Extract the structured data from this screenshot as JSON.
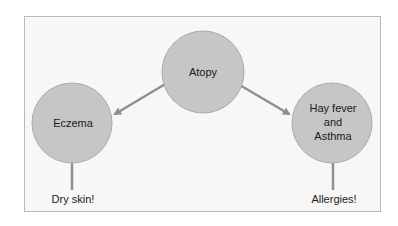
{
  "diagram": {
    "colors": {
      "background": "#f7f7f7",
      "border": "#b9b9b9",
      "node_fill": "#c6c6c6",
      "node_stroke": "#aaaaaa",
      "connector": "#8f8f8f",
      "text": "#1a1a1a"
    },
    "nodes": {
      "root": {
        "label": "Atopy"
      },
      "left": {
        "label": "Eczema"
      },
      "right": {
        "lines": [
          "Hay fever",
          "and",
          "Asthma"
        ]
      }
    },
    "leaves": {
      "left": {
        "label": "Dry skin!"
      },
      "right": {
        "label": "Allergies!"
      }
    }
  }
}
